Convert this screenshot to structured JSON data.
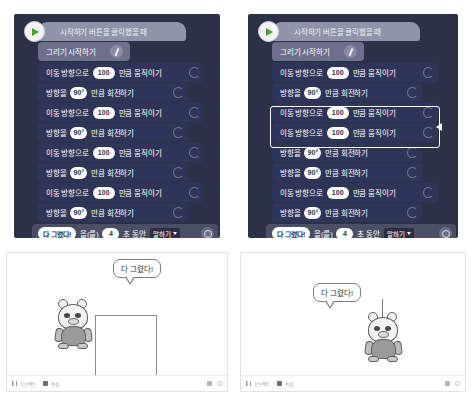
{
  "left_workspace": {
    "hat_label": "시작하기 버튼을 클릭했을 때",
    "flag_icon": "green-flag-play-icon",
    "pen_block": {
      "label": "그리기 시작하기",
      "icon": "pen-icon"
    },
    "blocks": [
      {
        "type": "move",
        "prefix": "이동 방향으로",
        "value": "100",
        "suffix": "만큼 움직이기"
      },
      {
        "type": "turn",
        "prefix": "방향을",
        "value": "90°",
        "suffix": "만큼 회전하기"
      },
      {
        "type": "move",
        "prefix": "이동 방향으로",
        "value": "100",
        "suffix": "만큼 움직이기"
      },
      {
        "type": "turn",
        "prefix": "방향을",
        "value": "90°",
        "suffix": "만큼 회전하기"
      },
      {
        "type": "move",
        "prefix": "이동 방향으로",
        "value": "100",
        "suffix": "만큼 움직이기"
      },
      {
        "type": "turn",
        "prefix": "방향을",
        "value": "90°",
        "suffix": "만큼 회전하기"
      },
      {
        "type": "move",
        "prefix": "이동 방향으로",
        "value": "100",
        "suffix": "만큼 움직이기"
      },
      {
        "type": "turn",
        "prefix": "방향을",
        "value": "90°",
        "suffix": "만큼 회전하기"
      }
    ],
    "say_block": {
      "message": "다 그렸다!",
      "particle": "을(를)",
      "seconds": "4",
      "duration_label": "초 동안",
      "dropdown": "말하기",
      "gear_icon": "gear-icon"
    }
  },
  "right_workspace": {
    "hat_label": "시작하기 버튼을 클릭했을 때",
    "flag_icon": "green-flag-play-icon",
    "pen_block": {
      "label": "그리기 시작하기",
      "icon": "pen-icon"
    },
    "blocks": [
      {
        "type": "move",
        "prefix": "이동 방향으로",
        "value": "100",
        "suffix": "만큼 움직이기",
        "selected": false
      },
      {
        "type": "turn",
        "prefix": "방향을",
        "value": "90°",
        "suffix": "만큼 회전하기",
        "selected": false
      },
      {
        "type": "move",
        "prefix": "이동 방향으로",
        "value": "100",
        "suffix": "만큼 움직이기",
        "selected": true
      },
      {
        "type": "move",
        "prefix": "이동 방향으로",
        "value": "100",
        "suffix": "만큼 움직이기",
        "selected": true
      },
      {
        "type": "turn",
        "prefix": "방향을",
        "value": "90°",
        "suffix": "만큼 회전하기",
        "selected": false
      },
      {
        "type": "turn",
        "prefix": "방향을",
        "value": "90°",
        "suffix": "만큼 회전하기",
        "selected": false
      },
      {
        "type": "move",
        "prefix": "이동 방향으로",
        "value": "100",
        "suffix": "만큼 움직이기",
        "selected": false
      },
      {
        "type": "turn",
        "prefix": "방향을",
        "value": "90°",
        "suffix": "만큼 회전하기",
        "selected": false
      }
    ],
    "selection": {
      "marker_icon": "drag-arrow-icon"
    },
    "say_block": {
      "message": "다 그렸다!",
      "particle": "을(를)",
      "seconds": "4",
      "duration_label": "초 동안",
      "dropdown": "말하기",
      "gear_icon": "gear-icon"
    }
  },
  "left_stage": {
    "speech": "다 그렸다!",
    "character_name": "entry-bot-character",
    "drawing": "완성된 정사각형"
  },
  "right_stage": {
    "speech": "다 그렸다!",
    "character_name": "entry-bot-character",
    "drawing": "그려지지 않은 선"
  },
  "left_toolbar": {
    "group1_label": "오브젝트",
    "group2_label": "속성"
  },
  "right_toolbar": {
    "group1_label": "오브젝트",
    "group2_label": "속성"
  },
  "colors": {
    "workspace_bg": "#2b3146",
    "move_block": "#2f3558",
    "turn_block": "#2f3558",
    "pen_block": "#6d6f8c",
    "say_block": "#4b4f66",
    "hat_block": "#8f95a8",
    "flag_green": "#4aa02c",
    "selection_outline": "#ffffff"
  }
}
